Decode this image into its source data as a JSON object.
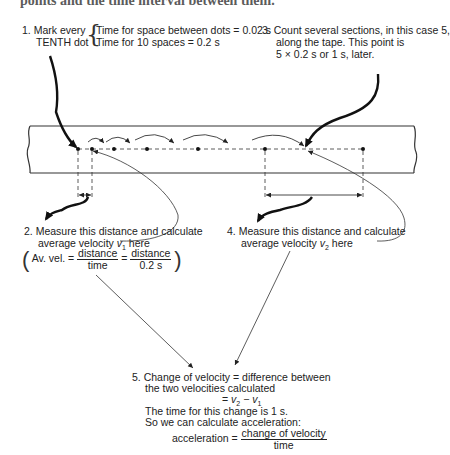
{
  "cut_off_header": "points and the time interval between them.",
  "step1": {
    "number": "1.",
    "line1": "Mark every",
    "line2": "TENTH dot",
    "brace_line1": "Time for space between dots = 0.02 s",
    "brace_line2": "Time for 10 spaces = 0.2 s"
  },
  "step3": {
    "number": "3.",
    "line1": "Count several sections, in this case 5,",
    "line2": "along the tape. This point is",
    "line3": "5 × 0.2 s  or 1 s, later."
  },
  "step2": {
    "number": "2.",
    "line1": "Measure this distance and calculate",
    "line2_prefix": "average velocity ",
    "line2_var": "v",
    "line2_sub": "1",
    "line2_suffix": " here",
    "formula_label": "Av. vel. =",
    "frac1_num": "distance",
    "frac1_den": "time",
    "equals": "=",
    "frac2_num": "distance",
    "frac2_den": "0.2 s"
  },
  "step4": {
    "number": "4.",
    "line1": "Measure this distance and calculate",
    "line2_prefix": "average velocity ",
    "line2_var": "v",
    "line2_sub": "2",
    "line2_suffix": " here"
  },
  "step5": {
    "number": "5.",
    "line1": "Change of velocity = difference between",
    "line2": "the two velocities calculated",
    "line3_eq": "= ",
    "line3_v2": "v",
    "line3_sub2": "2",
    "line3_minus": " − ",
    "line3_v1": "v",
    "line3_sub1": "1",
    "line4": "The time for this change is 1 s.",
    "line5": "So we can calculate acceleration:",
    "accel_label": "acceleration =",
    "accel_num": "change of velocity",
    "accel_den": "time"
  },
  "tape": {
    "dot_x": [
      78,
      92,
      114,
      147,
      198,
      265,
      363
    ],
    "dot_y": 149,
    "colors": {
      "line": "#333333",
      "background": "#ffffff"
    }
  }
}
